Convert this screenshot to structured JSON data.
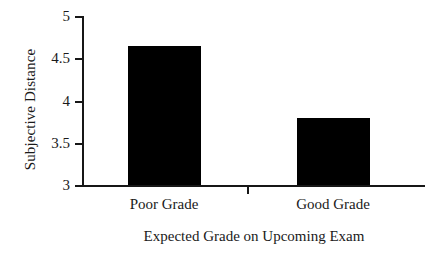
{
  "chart_data": {
    "type": "bar",
    "title": "",
    "subtitle": "",
    "categories": [
      "Poor Grade",
      "Good Grade"
    ],
    "values": [
      4.65,
      3.8
    ],
    "xlabel": "Expected Grade on Upcoming Exam",
    "ylabel": "Subjective Distance",
    "ylim": [
      3,
      5
    ],
    "yticks": [
      3,
      3.5,
      4,
      4.5,
      5
    ],
    "ytick_labels": [
      "3",
      "3.5",
      "4",
      "4.5",
      "5"
    ],
    "grid": false,
    "legend": false,
    "legend_position": "none",
    "bar_color": "#000000",
    "axis_color": "#171717",
    "background_color": "#ffffff"
  },
  "axes": {
    "y_title": "Subjective Distance",
    "x_title": "Expected Grade on Upcoming Exam",
    "y_ticks": [
      {
        "label": "5",
        "value": 5
      },
      {
        "label": "4.5",
        "value": 4.5
      },
      {
        "label": "4",
        "value": 4
      },
      {
        "label": "3.5",
        "value": 3.5
      },
      {
        "label": "3",
        "value": 3
      }
    ],
    "x_ticks": [
      {
        "label": "Poor Grade"
      },
      {
        "label": "Good Grade"
      }
    ]
  },
  "bars": [
    {
      "label": "Poor Grade",
      "value": 4.65
    },
    {
      "label": "Good Grade",
      "value": 3.8
    }
  ]
}
